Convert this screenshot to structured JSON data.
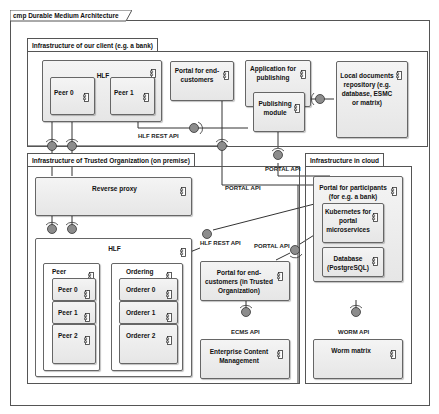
{
  "frame": {
    "title": "cmp Durable Medium Architecture"
  },
  "client_infra": {
    "title": "Infrastructure of our client (e.g. a bank)",
    "hlf": {
      "label": "HLF",
      "peers": [
        "Peer 0",
        "Peer 1"
      ]
    },
    "portal_end_customers": "Portal for end-customers",
    "app_publishing": {
      "label": "Application for publishing",
      "module": "Publishing module"
    },
    "local_docs": "Local documents repository (e.g. database, ESMC or matrix)"
  },
  "trusted_infra": {
    "title": "Infrastructure of Trusted Organization (on premise)",
    "reverse_proxy": "Reverse proxy",
    "hlf": {
      "label": "HLF",
      "peer_group": {
        "label": "Peer",
        "items": [
          "Peer 0",
          "Peer 1",
          "Peer 2"
        ]
      },
      "ordering_group": {
        "label": "Ordering",
        "items": [
          "Orderer 0",
          "Orderer 1",
          "Orderer 2"
        ]
      }
    },
    "portal_trusted": "Portal for end-customers (in Trusted Organization)",
    "ecm": "Enterprise Content Management"
  },
  "cloud_infra": {
    "title": "Infrastructure in cloud",
    "portal_participants": "Portal for participants (for e.g. a bank)",
    "kubernetes": "Kubernetes for portal microservices",
    "database": "Database (PostgreSQL)",
    "worm": "Worm matrix"
  },
  "apis": {
    "hlf_rest_top": "HLF REST API",
    "portal_api_left": "PORTAL API",
    "portal_api_right": "PORTAL API",
    "hlf_rest_mid": "HLF REST API",
    "portal_api_mid": "PORTAL API",
    "ecms_api": "ECMS API",
    "worm_api": "WORM API"
  },
  "colors": {
    "component_fill": "#ececec",
    "interface_ball": "#8c8c8c",
    "border": "#555555"
  }
}
